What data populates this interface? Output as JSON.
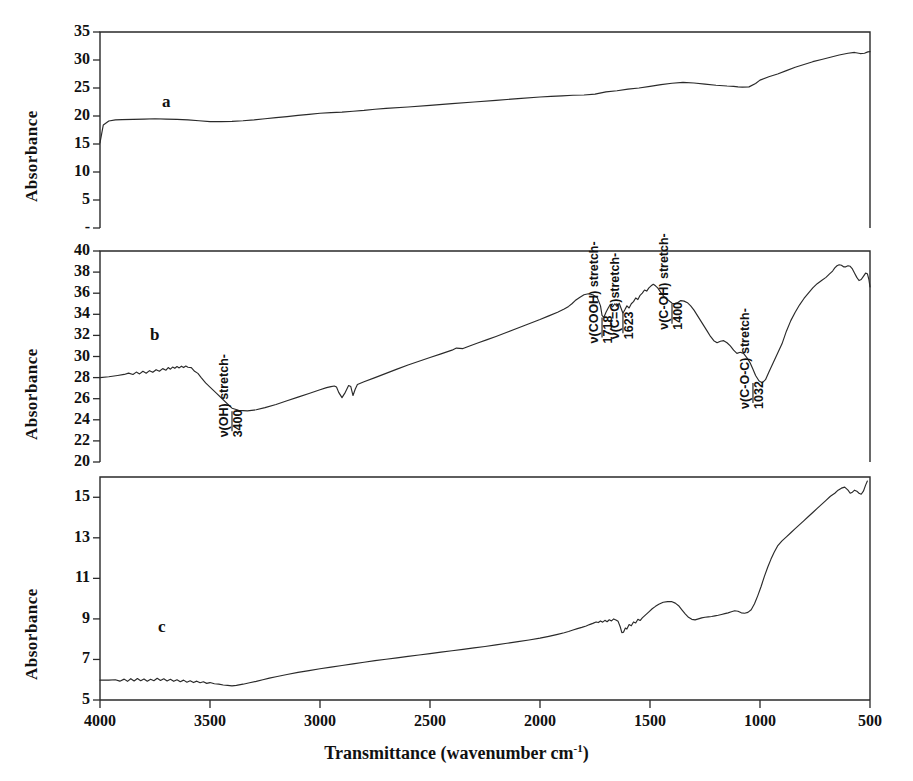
{
  "figure": {
    "axis_title_y": "Absorbance",
    "axis_title_x_main": "Transmittance (wavenumber cm",
    "axis_title_x_sup": "-1",
    "axis_title_x_tail": ")",
    "x_ticks": [
      "4000",
      "3500",
      "3000",
      "2500",
      "2000",
      "1500",
      "1000",
      "500"
    ],
    "panel_letters": [
      "a",
      "b",
      "c"
    ]
  },
  "chart_data": [
    {
      "type": "line",
      "id": "panel-a",
      "title": "a",
      "xlabel": "Transmittance (wavenumber cm-1)",
      "ylabel": "Absorbance",
      "xlim": [
        4000,
        500
      ],
      "ylim": [
        0,
        35
      ],
      "xticks": [
        4000,
        3500,
        3000,
        2500,
        2000,
        1500,
        1000,
        500
      ],
      "yticks": [
        0,
        5,
        10,
        15,
        20,
        25,
        30,
        35
      ],
      "ytick_labels": [
        "-",
        "5",
        "10",
        "15",
        "20",
        "25",
        "30",
        "35"
      ],
      "grid": false,
      "legend": "none",
      "annotations": [],
      "series": [
        {
          "name": "a",
          "x": [
            4000,
            3985,
            3960,
            3930,
            3900,
            3850,
            3800,
            3750,
            3700,
            3650,
            3600,
            3550,
            3500,
            3450,
            3400,
            3350,
            3300,
            3250,
            3200,
            3150,
            3100,
            3050,
            3000,
            2950,
            2900,
            2850,
            2800,
            2750,
            2700,
            2600,
            2500,
            2400,
            2300,
            2200,
            2100,
            2000,
            1950,
            1900,
            1850,
            1800,
            1750,
            1700,
            1650,
            1600,
            1550,
            1500,
            1450,
            1400,
            1350,
            1300,
            1250,
            1200,
            1150,
            1120,
            1100,
            1080,
            1050,
            1020,
            1000,
            960,
            920,
            880,
            840,
            800,
            760,
            720,
            680,
            640,
            600,
            570,
            545,
            525,
            510,
            500
          ],
          "y": [
            15.2,
            18.4,
            19.1,
            19.3,
            19.35,
            19.4,
            19.45,
            19.5,
            19.45,
            19.4,
            19.3,
            19.15,
            19.0,
            19.0,
            19.05,
            19.15,
            19.3,
            19.5,
            19.7,
            19.9,
            20.1,
            20.3,
            20.5,
            20.6,
            20.7,
            20.85,
            21.0,
            21.2,
            21.35,
            21.6,
            21.9,
            22.2,
            22.5,
            22.8,
            23.1,
            23.4,
            23.5,
            23.6,
            23.7,
            23.75,
            23.9,
            24.3,
            24.5,
            24.8,
            25.0,
            25.3,
            25.6,
            25.85,
            26.0,
            25.9,
            25.7,
            25.5,
            25.35,
            25.3,
            25.2,
            25.15,
            25.2,
            25.8,
            26.4,
            27.0,
            27.5,
            28.1,
            28.7,
            29.2,
            29.7,
            30.1,
            30.5,
            30.9,
            31.2,
            31.35,
            31.15,
            31.2,
            31.45,
            31.5
          ]
        }
      ]
    },
    {
      "type": "line",
      "id": "panel-b",
      "title": "b",
      "xlabel": "Transmittance (wavenumber cm-1)",
      "ylabel": "Absorbance",
      "xlim": [
        4000,
        500
      ],
      "ylim": [
        20,
        40
      ],
      "xticks": [
        4000,
        3500,
        3000,
        2500,
        2000,
        1500,
        1000,
        500
      ],
      "yticks": [
        20,
        22,
        24,
        26,
        28,
        30,
        32,
        34,
        36,
        38,
        40
      ],
      "ytick_labels": [
        "20",
        "22",
        "24",
        "26",
        "28",
        "30",
        "32",
        "34",
        "36",
        "38",
        "40"
      ],
      "grid": false,
      "legend": "none",
      "annotations": [
        {
          "label": "ν(OH) stretch-",
          "value": "3400",
          "wavenumber": 3400,
          "absorbance": 24.8
        },
        {
          "label": "ν(COOH) stretch-",
          "value": "1718",
          "wavenumber": 1718,
          "absorbance": 33.7
        },
        {
          "label": "ν(C=C)stretch-",
          "value": "1623",
          "wavenumber": 1623,
          "absorbance": 34.1
        },
        {
          "label": "ν(C-OH) stretch-",
          "value": "1400",
          "wavenumber": 1400,
          "absorbance": 35.0
        },
        {
          "label": "ν(C-O-C) stretch-",
          "value": "1032",
          "wavenumber": 1032,
          "absorbance": 27.5
        }
      ],
      "series": [
        {
          "name": "b",
          "x": [
            4000,
            3960,
            3920,
            3890,
            3870,
            3850,
            3835,
            3820,
            3805,
            3790,
            3775,
            3760,
            3745,
            3730,
            3715,
            3700,
            3690,
            3680,
            3670,
            3660,
            3650,
            3640,
            3630,
            3620,
            3610,
            3600,
            3585,
            3570,
            3555,
            3540,
            3520,
            3500,
            3470,
            3440,
            3410,
            3400,
            3370,
            3330,
            3290,
            3250,
            3200,
            3150,
            3100,
            3050,
            3000,
            2970,
            2950,
            2935,
            2925,
            2915,
            2900,
            2885,
            2870,
            2860,
            2850,
            2840,
            2830,
            2800,
            2750,
            2700,
            2650,
            2600,
            2550,
            2500,
            2450,
            2400,
            2380,
            2350,
            2320,
            2280,
            2240,
            2200,
            2150,
            2100,
            2050,
            2000,
            1960,
            1920,
            1890,
            1870,
            1855,
            1840,
            1820,
            1800,
            1780,
            1760,
            1740,
            1725,
            1718,
            1710,
            1700,
            1690,
            1680,
            1670,
            1660,
            1650,
            1640,
            1632,
            1623,
            1615,
            1605,
            1595,
            1585,
            1575,
            1565,
            1555,
            1545,
            1535,
            1525,
            1515,
            1505,
            1495,
            1485,
            1475,
            1465,
            1455,
            1445,
            1435,
            1425,
            1415,
            1405,
            1400,
            1390,
            1375,
            1360,
            1345,
            1330,
            1315,
            1300,
            1285,
            1270,
            1255,
            1240,
            1225,
            1210,
            1195,
            1180,
            1165,
            1150,
            1135,
            1120,
            1105,
            1090,
            1075,
            1060,
            1045,
            1032,
            1020,
            1005,
            990,
            975,
            960,
            940,
            920,
            900,
            880,
            860,
            840,
            820,
            800,
            780,
            760,
            740,
            720,
            700,
            685,
            670,
            660,
            650,
            640,
            630,
            620,
            610,
            600,
            590,
            580,
            570,
            560,
            550,
            540,
            530,
            520,
            512,
            505,
            500
          ],
          "y": [
            28.0,
            28.08,
            28.2,
            28.3,
            28.42,
            28.3,
            28.52,
            28.35,
            28.6,
            28.42,
            28.66,
            28.5,
            28.75,
            28.6,
            28.85,
            28.7,
            28.95,
            28.8,
            29.0,
            28.88,
            29.05,
            28.92,
            29.08,
            28.95,
            29.1,
            28.98,
            28.95,
            28.6,
            28.4,
            28.0,
            27.5,
            27.1,
            26.5,
            25.9,
            25.3,
            25.1,
            24.9,
            24.85,
            24.95,
            25.15,
            25.45,
            25.8,
            26.15,
            26.5,
            26.85,
            27.05,
            27.15,
            27.2,
            27.1,
            26.6,
            26.1,
            26.6,
            27.25,
            27.15,
            26.3,
            26.9,
            27.35,
            27.6,
            28.0,
            28.4,
            28.8,
            29.2,
            29.55,
            29.9,
            30.25,
            30.6,
            30.8,
            30.75,
            31.0,
            31.3,
            31.6,
            31.9,
            32.3,
            32.7,
            33.1,
            33.5,
            33.85,
            34.2,
            34.5,
            34.75,
            35.0,
            35.3,
            35.6,
            35.85,
            35.95,
            35.85,
            35.6,
            34.8,
            33.9,
            33.7,
            34.2,
            34.6,
            34.95,
            34.7,
            35.0,
            34.75,
            35.05,
            34.6,
            34.1,
            34.4,
            34.8,
            34.6,
            35.0,
            35.2,
            35.55,
            35.4,
            35.8,
            36.0,
            36.3,
            36.2,
            36.5,
            36.7,
            36.85,
            36.7,
            36.5,
            36.2,
            35.9,
            35.65,
            35.45,
            35.3,
            35.15,
            35.05,
            35.0,
            35.1,
            35.3,
            35.25,
            35.1,
            34.8,
            34.4,
            33.9,
            33.4,
            32.9,
            32.4,
            31.9,
            31.5,
            31.3,
            31.45,
            31.5,
            31.3,
            31.0,
            30.6,
            30.3,
            30.4,
            30.3,
            29.9,
            29.4,
            28.8,
            28.2,
            27.7,
            27.5,
            27.8,
            28.5,
            29.4,
            30.3,
            31.2,
            32.4,
            33.4,
            34.2,
            34.9,
            35.5,
            36.0,
            36.5,
            36.9,
            37.2,
            37.5,
            37.8,
            38.1,
            38.4,
            38.6,
            38.7,
            38.65,
            38.5,
            38.5,
            38.6,
            38.55,
            38.3,
            37.9,
            37.5,
            37.2,
            37.3,
            37.6,
            37.9,
            37.85,
            37.3,
            36.6,
            36.2,
            36.7,
            37.4,
            37.6
          ]
        }
      ]
    },
    {
      "type": "line",
      "id": "panel-c",
      "title": "c",
      "xlabel": "Transmittance (wavenumber cm-1)",
      "ylabel": "Absorbance",
      "xlim": [
        4000,
        500
      ],
      "ylim": [
        5,
        16
      ],
      "xticks": [
        4000,
        3500,
        3000,
        2500,
        2000,
        1500,
        1000,
        500
      ],
      "yticks": [
        5,
        7,
        9,
        11,
        13,
        15
      ],
      "ytick_labels": [
        "5",
        "7",
        "9",
        "11",
        "13",
        "15"
      ],
      "grid": false,
      "legend": "none",
      "annotations": [],
      "series": [
        {
          "name": "c",
          "x": [
            4000,
            3960,
            3930,
            3910,
            3890,
            3875,
            3860,
            3845,
            3830,
            3815,
            3800,
            3785,
            3770,
            3755,
            3740,
            3725,
            3710,
            3695,
            3680,
            3665,
            3650,
            3635,
            3620,
            3605,
            3590,
            3575,
            3560,
            3545,
            3530,
            3515,
            3500,
            3480,
            3460,
            3440,
            3420,
            3400,
            3380,
            3350,
            3320,
            3290,
            3260,
            3230,
            3200,
            3150,
            3100,
            3050,
            3000,
            2950,
            2900,
            2850,
            2800,
            2750,
            2700,
            2650,
            2600,
            2550,
            2500,
            2450,
            2400,
            2350,
            2300,
            2250,
            2200,
            2150,
            2100,
            2050,
            2000,
            1960,
            1920,
            1890,
            1870,
            1850,
            1830,
            1810,
            1790,
            1775,
            1760,
            1745,
            1735,
            1725,
            1715,
            1705,
            1695,
            1685,
            1675,
            1665,
            1655,
            1645,
            1635,
            1628,
            1620,
            1612,
            1605,
            1595,
            1585,
            1575,
            1565,
            1555,
            1545,
            1535,
            1520,
            1505,
            1490,
            1475,
            1460,
            1440,
            1420,
            1400,
            1385,
            1370,
            1355,
            1340,
            1325,
            1310,
            1295,
            1280,
            1265,
            1250,
            1235,
            1220,
            1205,
            1190,
            1175,
            1160,
            1145,
            1130,
            1115,
            1100,
            1085,
            1070,
            1055,
            1040,
            1025,
            1010,
            995,
            980,
            965,
            950,
            935,
            920,
            900,
            880,
            860,
            840,
            820,
            800,
            780,
            760,
            740,
            720,
            700,
            680,
            660,
            645,
            630,
            615,
            600,
            590,
            580,
            570,
            560,
            550,
            540,
            530,
            520,
            512,
            505,
            500
          ],
          "y": [
            5.98,
            5.98,
            6.0,
            5.93,
            6.03,
            5.92,
            6.05,
            5.94,
            6.06,
            5.95,
            6.04,
            5.93,
            6.02,
            5.95,
            6.07,
            5.96,
            6.05,
            5.94,
            6.02,
            5.92,
            6.0,
            5.9,
            5.98,
            5.88,
            5.95,
            5.86,
            5.93,
            5.85,
            5.9,
            5.82,
            5.86,
            5.8,
            5.78,
            5.74,
            5.72,
            5.7,
            5.72,
            5.78,
            5.85,
            5.92,
            6.0,
            6.08,
            6.15,
            6.26,
            6.36,
            6.45,
            6.54,
            6.62,
            6.7,
            6.78,
            6.86,
            6.94,
            7.01,
            7.08,
            7.15,
            7.22,
            7.29,
            7.36,
            7.43,
            7.5,
            7.57,
            7.64,
            7.72,
            7.8,
            7.88,
            7.96,
            8.05,
            8.14,
            8.24,
            8.32,
            8.38,
            8.45,
            8.52,
            8.58,
            8.65,
            8.72,
            8.78,
            8.85,
            8.82,
            8.9,
            8.84,
            8.93,
            8.86,
            8.96,
            8.9,
            9.0,
            8.95,
            8.88,
            8.6,
            8.32,
            8.35,
            8.55,
            8.5,
            8.72,
            8.66,
            8.85,
            8.8,
            8.98,
            8.92,
            9.05,
            9.2,
            9.35,
            9.5,
            9.62,
            9.72,
            9.82,
            9.85,
            9.85,
            9.78,
            9.65,
            9.45,
            9.25,
            9.08,
            8.98,
            8.95,
            9.0,
            9.05,
            9.08,
            9.1,
            9.12,
            9.15,
            9.18,
            9.22,
            9.26,
            9.3,
            9.35,
            9.4,
            9.38,
            9.3,
            9.28,
            9.32,
            9.45,
            9.75,
            10.15,
            10.6,
            11.1,
            11.55,
            11.95,
            12.3,
            12.6,
            12.85,
            13.05,
            13.25,
            13.45,
            13.65,
            13.85,
            14.05,
            14.25,
            14.45,
            14.65,
            14.85,
            15.05,
            15.2,
            15.35,
            15.45,
            15.5,
            15.35,
            15.2,
            15.25,
            15.35,
            15.3,
            15.2,
            15.15,
            15.3,
            15.6,
            15.8
          ]
        }
      ]
    }
  ]
}
